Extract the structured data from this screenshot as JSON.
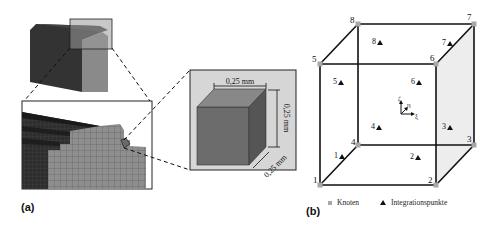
{
  "figure": {
    "panel_a": {
      "label": "(a)",
      "zoom_cube": {
        "dim_width": "0,25 mm",
        "dim_height": "0,25 mm",
        "dim_depth": "0,25 mm"
      }
    },
    "panel_b": {
      "label": "(b)",
      "nodes": [
        {
          "id": "1",
          "x": 320,
          "y": 185,
          "lx": 313,
          "ly": 183
        },
        {
          "id": "2",
          "x": 436,
          "y": 185,
          "lx": 428,
          "ly": 183
        },
        {
          "id": "3",
          "x": 474,
          "y": 145,
          "lx": 467,
          "ly": 142
        },
        {
          "id": "4",
          "x": 358,
          "y": 145,
          "lx": 351,
          "ly": 145
        },
        {
          "id": "5",
          "x": 320,
          "y": 64,
          "lx": 312,
          "ly": 62
        },
        {
          "id": "6",
          "x": 436,
          "y": 64,
          "lx": 430,
          "ly": 61
        },
        {
          "id": "7",
          "x": 474,
          "y": 24,
          "lx": 467,
          "ly": 20
        },
        {
          "id": "8",
          "x": 358,
          "y": 24,
          "lx": 350,
          "ly": 23
        }
      ],
      "integration_points": [
        {
          "id": "1",
          "x": 340,
          "y": 158
        },
        {
          "id": "2",
          "x": 416,
          "y": 159
        },
        {
          "id": "3",
          "x": 448,
          "y": 129
        },
        {
          "id": "4",
          "x": 377,
          "y": 129
        },
        {
          "id": "5",
          "x": 339,
          "y": 84
        },
        {
          "id": "6",
          "x": 417,
          "y": 84
        },
        {
          "id": "7",
          "x": 448,
          "y": 45
        },
        {
          "id": "8",
          "x": 378,
          "y": 44
        }
      ],
      "axes": {
        "zeta": "ζ",
        "eta": "η",
        "xi": "ξ"
      },
      "legend": {
        "nodes_label": "Knoten",
        "integration_label": "Integrationspunkte"
      }
    },
    "colors": {
      "node_marker": "#a8a8a8",
      "edge": "#111111",
      "shaded_face": "#ececec",
      "dark_material": "#3a3a3a",
      "light_material": "#8a8a8a",
      "inset_bg": "#d9d9d9"
    }
  }
}
